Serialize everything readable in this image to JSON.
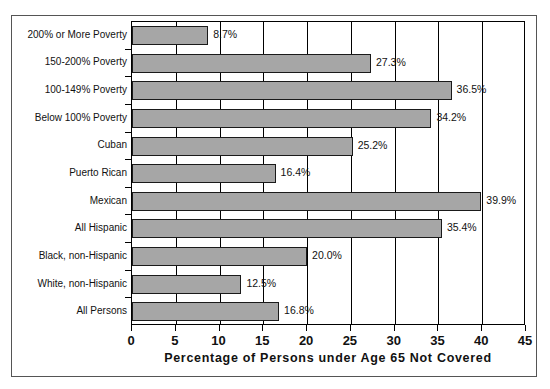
{
  "chart_data": {
    "type": "bar",
    "orientation": "horizontal",
    "title": "",
    "xlabel": "Percentage of Persons under Age 65 Not Covered",
    "ylabel": "",
    "xlim": [
      0,
      45
    ],
    "xticks": [
      0,
      5,
      10,
      15,
      20,
      25,
      30,
      35,
      40,
      45
    ],
    "xtick_labels": [
      "0",
      "5",
      "10",
      "15",
      "20",
      "25",
      "30",
      "35",
      "40",
      "45"
    ],
    "grid": "vertical",
    "legend": "none",
    "bar_color": "#a6a6a6",
    "bar_edge_color": "#1a1a1a",
    "categories": [
      "200% or More Poverty",
      "150-200% Poverty",
      "100-149% Poverty",
      "Below 100% Poverty",
      "Cuban",
      "Puerto Rican",
      "Mexican",
      "All Hispanic",
      "Black, non-Hispanic",
      "White, non-Hispanic",
      "All Persons"
    ],
    "values": [
      8.7,
      27.3,
      36.5,
      34.2,
      25.2,
      16.4,
      39.9,
      35.4,
      20.0,
      12.5,
      16.8
    ],
    "value_labels": [
      "8.7%",
      "27.3%",
      "36.5%",
      "34.2%",
      "25.2%",
      "16.4%",
      "39.9%",
      "35.4%",
      "20.0%",
      "12.5%",
      "16.8%"
    ]
  }
}
